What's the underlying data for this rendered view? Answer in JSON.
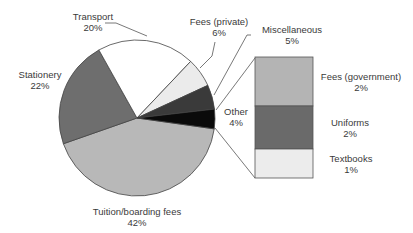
{
  "chart_data": {
    "type": "pie",
    "title": "",
    "slices": [
      {
        "label": "Tuition/boarding fees",
        "value": 42,
        "display": "42%",
        "color": "#b8b8b8"
      },
      {
        "label": "Stationery",
        "value": 22,
        "display": "22%",
        "color": "#6e6e6e"
      },
      {
        "label": "Transport",
        "value": 20,
        "display": "20%",
        "color": "#ffffff"
      },
      {
        "label": "Fees (private)",
        "value": 6,
        "display": "6%",
        "color": "#ebebeb"
      },
      {
        "label": "Miscellaneous",
        "value": 5,
        "display": "5%",
        "color": "#3a3a3a"
      },
      {
        "label": "Other",
        "value": 4,
        "display": "4%",
        "color": "#0a0a0a"
      }
    ],
    "breakdown": {
      "of": "Other",
      "type": "stacked-bar",
      "segments": [
        {
          "label": "Fees (government)",
          "value": 2,
          "display": "2%",
          "color": "#b4b4b4"
        },
        {
          "label": "Uniforms",
          "value": 2,
          "display": "2%",
          "color": "#6a6a6a"
        },
        {
          "label": "Textbooks",
          "value": 1,
          "display": "1%",
          "color": "#ececec"
        }
      ]
    },
    "legend": "none (direct labels)"
  },
  "labels": {
    "transport": {
      "name": "Transport",
      "pct": "20%"
    },
    "fees_private": {
      "name": "Fees (private)",
      "pct": "6%"
    },
    "miscellaneous": {
      "name": "Miscellaneous",
      "pct": "5%"
    },
    "stationery": {
      "name": "Stationery",
      "pct": "22%"
    },
    "other": {
      "name": "Other",
      "pct": "4%"
    },
    "tuition": {
      "name": "Tuition/boarding fees",
      "pct": "42%"
    },
    "fees_government": {
      "name": "Fees (government)",
      "pct": "2%"
    },
    "uniforms": {
      "name": "Uniforms",
      "pct": "2%"
    },
    "textbooks": {
      "name": "Textbooks",
      "pct": "1%"
    }
  }
}
